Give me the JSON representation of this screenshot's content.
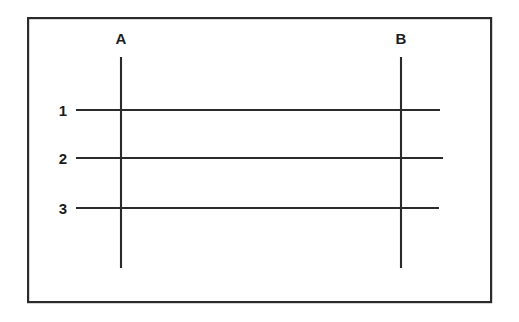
{
  "figure": {
    "title": "",
    "type": "line-diagram",
    "background_color": "#ffffff",
    "stroke_color": "#2b2b2b",
    "label_color": "#1c1c1c",
    "frame": {
      "name": "outer-border-rectangle",
      "x": 27,
      "y": 17,
      "width": 465,
      "height": 286,
      "stroke_width": 2.2
    },
    "vertical_lines": [
      {
        "label": "A",
        "x": 121,
        "y_top": 57,
        "y_bottom": 268,
        "stroke_width": 2.1,
        "label_x": 121,
        "label_y": 38
      },
      {
        "label": "B",
        "x": 401,
        "y_top": 57,
        "y_bottom": 268,
        "stroke_width": 2.1,
        "label_x": 401,
        "label_y": 38
      }
    ],
    "horizontal_lines": [
      {
        "label": "1",
        "y": 110,
        "x_start": 76,
        "x_end": 440,
        "stroke_width": 1.9,
        "label_x": 63,
        "label_y": 110
      },
      {
        "label": "2",
        "y": 158,
        "x_start": 76,
        "x_end": 443,
        "stroke_width": 1.9,
        "label_x": 63,
        "label_y": 158
      },
      {
        "label": "3",
        "y": 208,
        "x_start": 76,
        "x_end": 439,
        "stroke_width": 1.9,
        "label_x": 63,
        "label_y": 208
      }
    ]
  }
}
